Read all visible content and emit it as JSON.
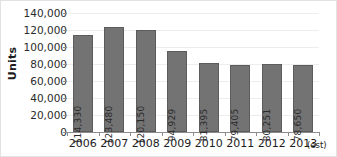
{
  "chart_data": {
    "type": "bar",
    "title": "",
    "xlabel": "",
    "ylabel": "Units",
    "categories": [
      "2006",
      "2007",
      "2008",
      "2009",
      "2010",
      "2011",
      "2012",
      "2013"
    ],
    "category_suffix": "(est)",
    "values": [
      114330,
      123480,
      120150,
      94929,
      81395,
      79405,
      80251,
      78650
    ],
    "value_labels": [
      "114,330",
      "123,480",
      "120,150",
      "94,929",
      "81,395",
      "79,405",
      "80,251",
      "78,650"
    ],
    "ylim": [
      0,
      140000
    ],
    "ytick_labels": [
      "0",
      "20,000",
      "40,000",
      "60,000",
      "80,000",
      "100,000",
      "120,000",
      "140,000"
    ],
    "ytick_values": [
      0,
      20000,
      40000,
      60000,
      80000,
      100000,
      120000,
      140000
    ],
    "grid": true,
    "legend": "none",
    "bar_color": "#737373",
    "bar_border_color": "#5c5c5c",
    "grid_color": "#ededed",
    "axis_color": "#8d8d8d",
    "text_color": "#1c1c1c",
    "background": "#ffffff"
  }
}
